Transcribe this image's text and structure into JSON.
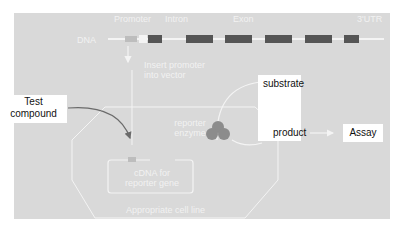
{
  "colors": {
    "panel_bg": "#d9d9d9",
    "exon": "#555555",
    "lines": "#f4f4f4",
    "arrow_dark": "#6b6b6b",
    "enzyme": "#8c8c8c",
    "text_light": "#f2f2f2",
    "text_dark": "#111111"
  },
  "gene_track": {
    "labels": {
      "promoter": "Promoter",
      "intron": "Intron",
      "exon": "Exon",
      "utr": "3'UTR"
    },
    "dna_label": "DNA",
    "exon_count": 6
  },
  "steps": {
    "insert_promoter": "Insert promoter\ninto vector"
  },
  "cell": {
    "label": "Appropriate cell line",
    "cdna_label": "cDNA for\nreporter gene",
    "enzyme_label": "reporter\nenzyme"
  },
  "inputs": {
    "test_compound": "Test\ncompound"
  },
  "reaction": {
    "substrate": "substrate",
    "product": "product",
    "assay": "Assay"
  }
}
